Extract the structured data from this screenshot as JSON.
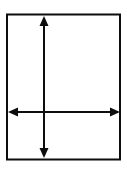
{
  "figure": {
    "canvas": {
      "width": 127,
      "height": 169,
      "background_color": "#ffffff"
    },
    "stroke_color": "#0d0d0d",
    "fill_color": "#ffffff",
    "shapes": {
      "rectangle": {
        "label": "Rectangle outline",
        "x": 7,
        "y": 14.5,
        "width": 113,
        "height": 145,
        "stroke_width": 2,
        "fill": "none"
      },
      "vertical_arrow": {
        "label": "Vertical double-headed arrow",
        "x": 44,
        "y_top": 17,
        "y_bottom": 157,
        "stroke_width": 2,
        "arrowhead_width": 9,
        "arrowhead_length": 10,
        "heads": "both"
      },
      "horizontal_arrow": {
        "label": "Horizontal double-headed arrow",
        "y": 112,
        "x_left": 9,
        "x_right": 119,
        "stroke_width": 2,
        "arrowhead_width": 9,
        "arrowhead_length": 10,
        "heads": "both"
      }
    },
    "intersection": {
      "label": "Arrow crossing point",
      "x": 44,
      "y": 112
    }
  }
}
